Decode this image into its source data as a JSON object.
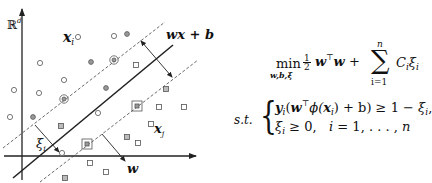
{
  "figure": {
    "space_label": "ℝ",
    "space_superscript": "d",
    "point_i_label": "x",
    "point_i_sub": "i",
    "point_j_label": "x",
    "point_j_sub": "j",
    "hyperplane_label": "wx + b",
    "slack_label": "ξ",
    "slack_sub": "i",
    "normal_label": "w",
    "colors": {
      "ink": "#222222",
      "marker": "#555555",
      "dashed": "#444444",
      "background": "#ffffff"
    },
    "class_positive_points": [
      [
        78,
        37
      ],
      [
        114,
        36
      ],
      [
        127,
        34
      ],
      [
        40,
        63
      ],
      [
        91,
        62
      ],
      [
        64,
        80
      ],
      [
        106,
        88
      ],
      [
        14,
        90
      ],
      [
        39,
        93
      ],
      [
        10,
        117
      ],
      [
        33,
        117
      ],
      [
        98,
        113
      ],
      [
        62,
        153
      ]
    ],
    "class_positive_support_vectors": [
      [
        114,
        60
      ],
      [
        64,
        99
      ]
    ],
    "class_negative_points": [
      [
        136,
        65
      ],
      [
        166,
        89
      ],
      [
        159,
        107
      ],
      [
        184,
        107
      ],
      [
        61,
        126
      ],
      [
        151,
        124
      ],
      [
        127,
        137
      ],
      [
        138,
        143
      ],
      [
        90,
        163
      ],
      [
        106,
        172
      ],
      [
        65,
        178
      ]
    ],
    "class_negative_support_vectors": [
      [
        137,
        106
      ],
      [
        87,
        144
      ]
    ]
  },
  "formula": {
    "objective": {
      "operator": "min",
      "operator_sub": "w,b,ξ",
      "frac_num": "1",
      "frac_den": "2",
      "term1": "w",
      "transpose": "⊤",
      "term2": "w",
      "plus": "+",
      "sum_symbol": "∑",
      "sum_upper": "n",
      "sum_lower": "i=1",
      "sum_term": "C",
      "sum_term_sub": "i",
      "sum_term2": "ξ",
      "sum_term2_sub": "i"
    },
    "subject_to_label": "s.t.",
    "constraint_1": {
      "lhs_y": "y",
      "lhs_y_sub": "i",
      "open": "(",
      "w": "w",
      "transpose": "⊤",
      "phi": "ϕ(",
      "x": "x",
      "x_sub": "i",
      "rest": ") + b) ≥ 1 − ",
      "xi": "ξ",
      "xi_sub": "i",
      "trail": ","
    },
    "constraint_2": {
      "xi": "ξ",
      "xi_sub": "i",
      "cond": " ≥ 0,",
      "range_var": "i",
      "range": " = 1, . . . , ",
      "range_end": "n"
    }
  }
}
